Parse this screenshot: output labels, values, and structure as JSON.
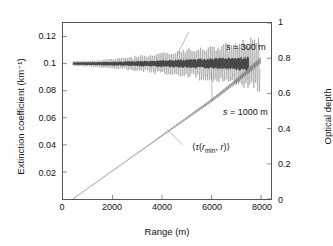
{
  "chart_data": {
    "type": "line",
    "title": "",
    "xlabel": "Range (m)",
    "ylabel": "Extinction coefficient (km⁻¹)",
    "ylabel_right": "Optical depth",
    "xlim": [
      0,
      8400
    ],
    "ylim": [
      0,
      0.13
    ],
    "ylim_right": [
      0,
      1.0
    ],
    "grid": false,
    "legend": "none (inline annotations)",
    "xticks": [
      0,
      2000,
      4000,
      6000,
      8000
    ],
    "xticklabels": [
      "0",
      "2000",
      "4000",
      "6000",
      "8000"
    ],
    "yticks_left": [
      0.02,
      0.04,
      0.06,
      0.08,
      0.1,
      0.12
    ],
    "yticklabels_left": [
      "0.02",
      "0.04",
      "0.06",
      "0.08",
      "0.1",
      "0.12"
    ],
    "yticks_right": [
      0,
      0.2,
      0.4,
      0.6,
      0.8,
      1
    ],
    "yticklabels_right": [
      "0",
      "0.2",
      "0.4",
      "0.6",
      "0.8",
      "1"
    ],
    "annotations": [
      {
        "text": "s = 300 m",
        "x": 5400,
        "y": 0.125,
        "leader_to_x": 4600,
        "leader_to_y": 0.106
      },
      {
        "text": "s = 1000 m",
        "x": 5300,
        "y": 0.0715,
        "leader_to_x": 6000,
        "leader_to_y": 0.0935
      },
      {
        "text": "⟨τ(r_min, r)⟩",
        "x": 3300,
        "y": 0.0505,
        "leader_to_x": 4500,
        "leader_to_y": 0.0415
      }
    ],
    "series": [
      {
        "name": "s = 1000 m",
        "axis": "left",
        "description": "Retrieved extinction coefficient, smoothing length 1000 m: oscillates about 0.1 km^-1 with noise amplitude growing with range",
        "color": "#8c8c8c",
        "mean_value": 0.1,
        "x_start": 400,
        "x_end": 7950,
        "noise_amplitude_start": 0.0015,
        "noise_amplitude_end": 0.016
      },
      {
        "name": "s = 300 m",
        "axis": "left",
        "description": "Retrieved extinction coefficient, smoothing length 300 m: tighter oscillation about 0.1 km^-1",
        "color": "#2b2b2b",
        "mean_value": 0.1,
        "x_start": 400,
        "x_end": 7500,
        "noise_amplitude_start": 0.0008,
        "noise_amplitude_end": 0.0042
      },
      {
        "name": "⟨τ(r_min, r)⟩",
        "axis": "right",
        "description": "Mean optical depth accumulated from r_min to r; near-linear rise with small oscillations growing with range",
        "color": "#707070",
        "x": [
          400,
          1000,
          2000,
          3000,
          4000,
          5000,
          6000,
          7000,
          8000
        ],
        "values": [
          0.0,
          0.06,
          0.16,
          0.26,
          0.36,
          0.46,
          0.56,
          0.67,
          0.79
        ]
      }
    ]
  },
  "axes": {
    "left_title": "Extinction coefficient (km⁻¹)",
    "right_title": "Optical depth",
    "bottom_title": "Range (m)"
  },
  "annotations": {
    "s300": "s = 300 m",
    "s1000": "s = 1000 m",
    "tau_open": "⟨",
    "tau_symbol": "τ",
    "tau_paren_open": "(",
    "tau_r": "r",
    "tau_min": "min",
    "tau_comma": ", ",
    "tau_r2": "r",
    "tau_paren_close": ")",
    "tau_close": "⟩"
  }
}
